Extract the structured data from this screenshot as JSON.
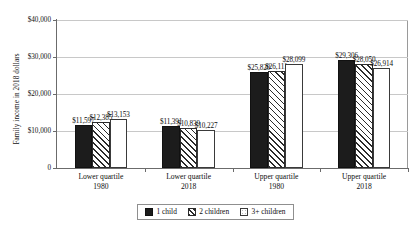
{
  "chart_data": {
    "type": "bar",
    "title": "",
    "subtitle": "",
    "xlabel": "",
    "ylabel": "Family income in 2018 dollars",
    "ylim": [
      0,
      40000
    ],
    "grid": "horizontal",
    "legend_position": "bottom",
    "categories": [
      {
        "name": "Lower quartile",
        "year": "1980"
      },
      {
        "name": "Lower quartile",
        "year": "2018"
      },
      {
        "name": "Upper quartile",
        "year": "1980"
      },
      {
        "name": "Upper quartile",
        "year": "2018"
      }
    ],
    "category_labels": [
      "Lower quartile 1980",
      "Lower quartile 2018",
      "Upper quartile 1980",
      "Upper quartile 2018"
    ],
    "series": [
      {
        "name": "1 child",
        "values": [
          11597,
          11391,
          25820,
          29306
        ],
        "labels": [
          "$11,597",
          "$11,391",
          "$25,820",
          "$29,306"
        ],
        "style": "solid-black"
      },
      {
        "name": "2 children",
        "values": [
          12385,
          10839,
          26111,
          28050
        ],
        "labels": [
          "$12,385",
          "$10,839",
          "$26,111",
          "$28,050"
        ],
        "style": "diagonal-hatch"
      },
      {
        "name": "3+ children",
        "values": [
          13153,
          10227,
          28099,
          26914
        ],
        "labels": [
          "$13,153",
          "$10,227",
          "$28,099",
          "$26,914"
        ],
        "style": "white-outline"
      }
    ],
    "yticks": [
      0,
      10000,
      20000,
      30000,
      40000
    ],
    "ytick_labels": [
      "0",
      "$10,000",
      "$20,000",
      "$30,000",
      "$40,000"
    ]
  },
  "legend": {
    "items": [
      {
        "label": "1 child"
      },
      {
        "label": "2 children"
      },
      {
        "label": "3+ children"
      }
    ]
  }
}
